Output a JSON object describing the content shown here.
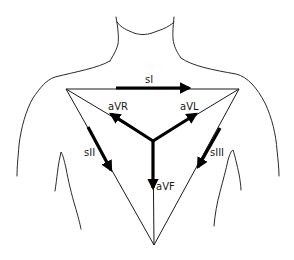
{
  "diagram": {
    "colors": {
      "ink": "#000000",
      "background": "#ffffff"
    },
    "labels": {
      "lead_I": "sI",
      "lead_II": "sII",
      "lead_III": "sIII",
      "aVR": "aVR",
      "aVL": "aVL",
      "aVF": "aVF"
    },
    "nodes": [
      {
        "id": "RA",
        "x": 66,
        "y": 89
      },
      {
        "id": "LA",
        "x": 239,
        "y": 89
      },
      {
        "id": "LL",
        "x": 154,
        "y": 245
      },
      {
        "id": "center",
        "x": 153,
        "y": 141
      }
    ],
    "edges": [
      {
        "from": "RA",
        "to": "LA",
        "type": "triangle-side"
      },
      {
        "from": "RA",
        "to": "LL",
        "type": "triangle-side"
      },
      {
        "from": "LA",
        "to": "LL",
        "type": "triangle-side"
      },
      {
        "from": "RA",
        "to": "center",
        "type": "bisector"
      },
      {
        "from": "LA",
        "to": "center",
        "type": "bisector"
      },
      {
        "from": "center",
        "to": "LL",
        "type": "bisector"
      }
    ],
    "vectors": [
      {
        "name": "sI",
        "from": [
          116,
          88
        ],
        "to": [
          189,
          88
        ]
      },
      {
        "name": "sII",
        "from": [
          88,
          127
        ],
        "to": [
          111,
          170
        ]
      },
      {
        "name": "sIII",
        "from": [
          220,
          128
        ],
        "to": [
          198,
          167
        ]
      },
      {
        "name": "aVR",
        "from": [
          153,
          141
        ],
        "to": [
          111,
          114
        ]
      },
      {
        "name": "aVL",
        "from": [
          153,
          141
        ],
        "to": [
          196,
          114
        ]
      },
      {
        "name": "aVF",
        "from": [
          153,
          141
        ],
        "to": [
          153,
          188
        ]
      }
    ]
  }
}
